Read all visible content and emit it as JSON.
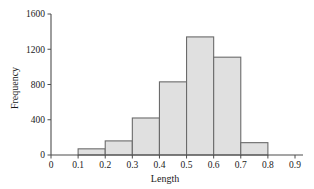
{
  "chart_data": {
    "type": "bar",
    "title": "",
    "xlabel": "Length",
    "ylabel": "Frequency",
    "xlim": [
      0,
      0.9
    ],
    "ylim": [
      0,
      1600
    ],
    "grid": false,
    "legend": null,
    "bin_width": 0.1,
    "bin_edges": [
      0.1,
      0.2,
      0.3,
      0.4,
      0.5,
      0.6,
      0.7,
      0.8
    ],
    "categories": [
      "0.1-0.2",
      "0.2-0.3",
      "0.3-0.4",
      "0.4-0.5",
      "0.5-0.6",
      "0.6-0.7",
      "0.7-0.8"
    ],
    "values": [
      70,
      160,
      420,
      830,
      1340,
      1110,
      140
    ],
    "bars": [
      {
        "x0": 0.1,
        "x1": 0.2,
        "value": 70
      },
      {
        "x0": 0.2,
        "x1": 0.3,
        "value": 160
      },
      {
        "x0": 0.3,
        "x1": 0.4,
        "value": 420
      },
      {
        "x0": 0.4,
        "x1": 0.5,
        "value": 830
      },
      {
        "x0": 0.5,
        "x1": 0.6,
        "value": 1340
      },
      {
        "x0": 0.6,
        "x1": 0.7,
        "value": 1110
      },
      {
        "x0": 0.7,
        "x1": 0.8,
        "value": 140
      }
    ],
    "xticks": [
      0,
      0.1,
      0.2,
      0.3,
      0.4,
      0.5,
      0.6,
      0.7,
      0.8,
      0.9
    ],
    "xtick_labels": [
      "0",
      "0.1",
      "0.2",
      "0.3",
      "0.4",
      "0.5",
      "0.6",
      "0.7",
      "0.8",
      "0.9"
    ],
    "yticks": [
      0,
      400,
      800,
      1200,
      1600
    ],
    "ytick_labels": [
      "0",
      "400",
      "800",
      "1200",
      "1600"
    ],
    "colors": {
      "bar_fill": "#e0e0e0",
      "bar_stroke": "#6b6b6b",
      "axis": "#4d4d4d",
      "text": "#1a1a1a",
      "background": "#ffffff"
    }
  }
}
